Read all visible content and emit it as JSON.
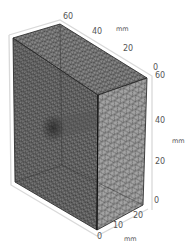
{
  "figure": {
    "colors": {
      "background": "#ffffff",
      "mesh_face_left": "#6f6f6f",
      "mesh_face_top": "#8a8a8a",
      "mesh_face_front": "#9a9a9a",
      "mesh_line": "#2b2b2b",
      "axis_box": "#d9d9d9",
      "label": "#555555"
    }
  },
  "axes": {
    "top_axis": {
      "ticks": [
        "60",
        "40",
        "20",
        "0"
      ],
      "unit": "mm"
    },
    "vertical_axis": {
      "ticks": [
        "60",
        "40",
        "20",
        "0"
      ],
      "unit": "mm"
    },
    "bottom_axis": {
      "ticks": [
        "0",
        "10",
        "20"
      ],
      "unit": "mm"
    }
  }
}
